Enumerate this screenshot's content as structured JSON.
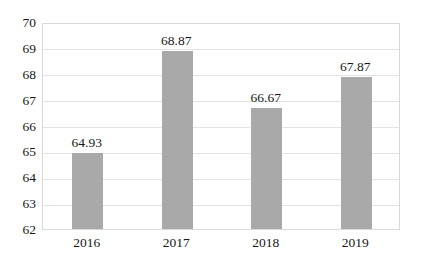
{
  "chart_data": {
    "type": "bar",
    "title": "",
    "subtitle": "",
    "xlabel": "",
    "ylabel": "",
    "categories": [
      "2016",
      "2017",
      "2018",
      "2019"
    ],
    "values": [
      64.93,
      68.87,
      66.67,
      67.87
    ],
    "value_labels": [
      "64.93",
      "68.87",
      "66.67",
      "67.87"
    ],
    "ylim": [
      62,
      70
    ],
    "ytick_labels": [
      "70",
      "69",
      "68",
      "67",
      "66",
      "65",
      "64",
      "63",
      "62"
    ],
    "ytick_values": [
      70,
      69,
      68,
      67,
      66,
      65,
      64,
      63,
      62
    ],
    "grid": "horizontal",
    "legend": "none",
    "series": [
      {
        "name": "",
        "values": [
          64.93,
          68.87,
          66.67,
          67.87
        ]
      }
    ],
    "colors": {
      "bar_fill": "#a9a9a9",
      "gridline": "#e3e3e3",
      "plot_border": "#d9d9d9",
      "background": "#ffffff",
      "text": "#171717"
    }
  }
}
